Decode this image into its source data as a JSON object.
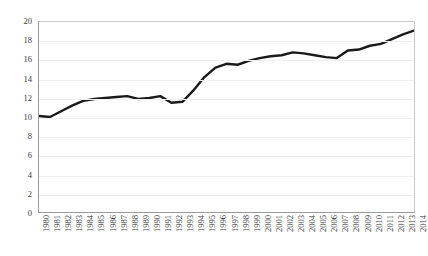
{
  "chart_data": {
    "type": "line",
    "title": "",
    "subtitle": "",
    "xlabel": "",
    "ylabel": "",
    "xlim": [
      1980,
      2014
    ],
    "ylim": [
      0,
      20
    ],
    "y_ticks": [
      0,
      2,
      4,
      6,
      8,
      10,
      12,
      14,
      16,
      18,
      20
    ],
    "grid": "horizontal",
    "legend": "none",
    "categories": [
      "1980",
      "1981",
      "1982",
      "1983",
      "1984",
      "1985",
      "1986",
      "1987",
      "1988",
      "1989",
      "1990",
      "1991",
      "1992",
      "1993",
      "1994",
      "1995",
      "1996",
      "1997",
      "1998",
      "1999",
      "2000",
      "2001",
      "2002",
      "2003",
      "2004",
      "2005",
      "2006",
      "2007",
      "2008",
      "2009",
      "2010",
      "2011",
      "2012",
      "2013",
      "2014"
    ],
    "values": [
      10.1,
      10.0,
      10.6,
      11.2,
      11.7,
      11.9,
      12.0,
      12.1,
      12.2,
      11.9,
      12.0,
      12.2,
      11.5,
      11.6,
      12.8,
      14.2,
      15.2,
      15.6,
      15.5,
      15.9,
      16.2,
      16.4,
      16.5,
      16.8,
      16.7,
      16.5,
      16.3,
      16.2,
      17.0,
      17.1,
      17.5,
      17.7,
      18.2,
      18.7,
      19.1
    ],
    "series_color": "#1a1a1a",
    "series_width": 2.4,
    "grid_color": "#efefef",
    "axis_color": "#9a9a9a",
    "text_color": "#3a3a3a",
    "background": "#ffffff"
  }
}
